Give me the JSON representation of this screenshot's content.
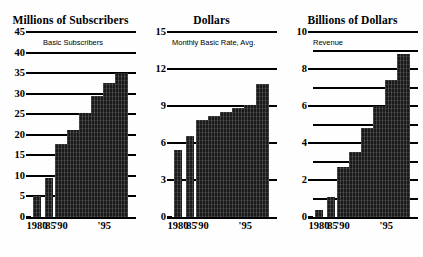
{
  "figure": {
    "background": "#fefefe",
    "bar_color": "#1a1a1a",
    "axis_color": "#000000"
  },
  "panels": [
    {
      "id": "subscribers",
      "title": "Millions of Subscribers",
      "legend": "Basic Subscribers",
      "ylabels": [
        "45",
        "40",
        "35",
        "30",
        "25",
        "20",
        "15",
        "10",
        "5",
        "0"
      ],
      "xlabels": [
        "1980",
        "'85",
        "'90",
        "'95"
      ],
      "chart_data": {
        "type": "bar",
        "title": "Millions of Subscribers",
        "xlabel": "",
        "ylabel": "Millions of Subscribers",
        "ylim": [
          0,
          45
        ],
        "yticks": [
          0,
          5,
          10,
          15,
          20,
          25,
          30,
          35,
          40,
          45
        ],
        "grid": true,
        "legend": "Basic Subscribers",
        "legend_position": "top-left",
        "categories": [
          "1980",
          "1985",
          "1990",
          "1991",
          "1992",
          "1993",
          "1994",
          "1995"
        ],
        "values": [
          5.0,
          9.6,
          17.7,
          21.1,
          25.3,
          29.5,
          32.5,
          35.0
        ]
      }
    },
    {
      "id": "rate",
      "title": "Dollars",
      "legend": "Monthly Basic Rate, Avg.",
      "ylabels": [
        "15",
        "12",
        "9",
        "6",
        "3",
        "0"
      ],
      "xlabels": [
        "1980",
        "'85",
        "'90",
        "'95"
      ],
      "chart_data": {
        "type": "bar",
        "title": "Dollars",
        "xlabel": "",
        "ylabel": "Dollars",
        "ylim": [
          0,
          15
        ],
        "yticks": [
          0,
          3,
          6,
          9,
          12,
          15
        ],
        "grid": true,
        "legend": "Monthly Basic Rate, Avg.",
        "legend_position": "top-left",
        "categories": [
          "1980",
          "1985",
          "1990",
          "1991",
          "1992",
          "1993",
          "1994",
          "1995"
        ],
        "values": [
          5.4,
          6.6,
          7.9,
          8.2,
          8.5,
          8.8,
          9.1,
          10.8
        ]
      }
    },
    {
      "id": "revenue",
      "title": "Billions of Dollars",
      "legend": "Revenue",
      "ylabels": [
        "10",
        "8",
        "6",
        "4",
        "2",
        "0"
      ],
      "xlabels": [
        "1980",
        "'85",
        "'90",
        "'95"
      ],
      "chart_data": {
        "type": "bar",
        "title": "Billions of Dollars",
        "xlabel": "",
        "ylabel": "Billions of Dollars",
        "ylim": [
          0,
          10
        ],
        "yticks": [
          0,
          2,
          4,
          6,
          8,
          10
        ],
        "minor_yticks": [
          1,
          3,
          5,
          7,
          9
        ],
        "grid": true,
        "legend": "Revenue",
        "legend_position": "top-left",
        "categories": [
          "1980",
          "1985",
          "1990",
          "1991",
          "1992",
          "1993",
          "1994",
          "1995"
        ],
        "values": [
          0.4,
          1.1,
          2.7,
          3.5,
          4.8,
          6.0,
          7.4,
          8.8
        ]
      }
    }
  ]
}
